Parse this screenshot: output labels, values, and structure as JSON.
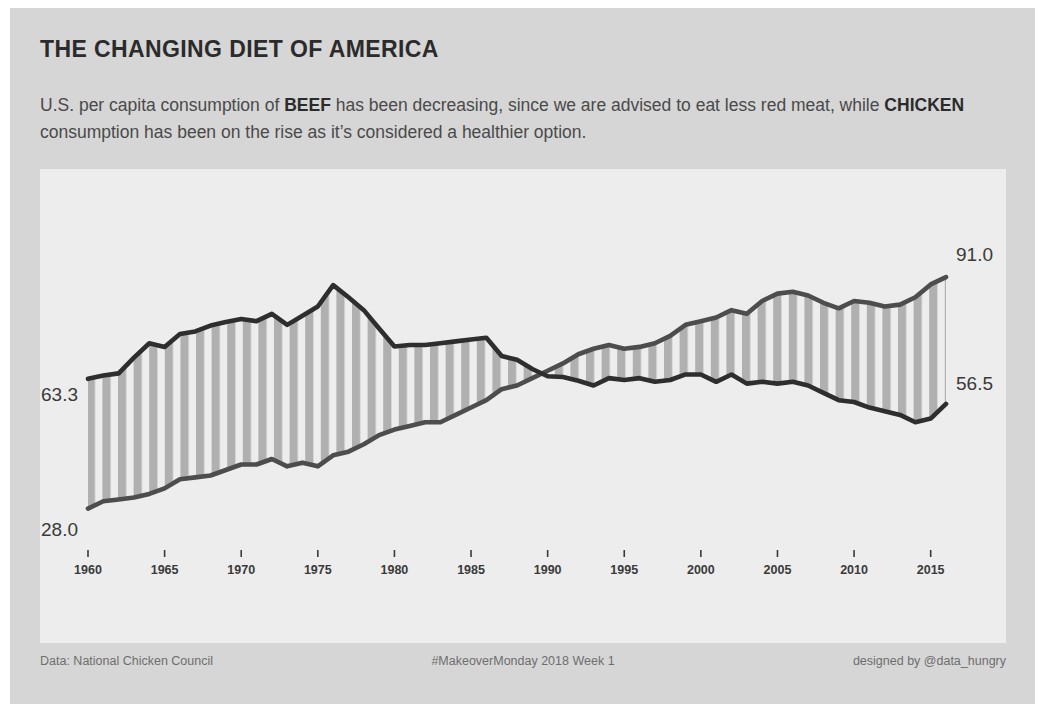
{
  "header": {
    "title": "THE CHANGING DIET OF AMERICA",
    "subtitle_part1": "U.S. per capita consumption of ",
    "subtitle_bold1": "BEEF",
    "subtitle_part2": " has been decreasing, since we are advised to eat less red meat, while ",
    "subtitle_bold2": "CHICKEN",
    "subtitle_part3": " consumption has been on the rise as it’s considered a healthier option."
  },
  "footer": {
    "source": "Data: National Chicken Council",
    "hashtag": "#MakeoverMonday 2018 Week 1",
    "credit": "designed by @data_hungry"
  },
  "colors": {
    "card_background": "#d6d6d6",
    "panel_background": "#ededed",
    "beef_line": "#2e2e2e",
    "chicken_line": "#4d4d4d",
    "band_stripe": "#b0b0b0",
    "text_primary": "#2b2b2b",
    "text_secondary": "#4a4a4a",
    "text_muted": "#6e6e6e"
  },
  "chart_data": {
    "type": "line",
    "title": "THE CHANGING DIET OF AMERICA",
    "subtitle": "U.S. per capita consumption of BEEF has been decreasing, since we are advised to eat less red meat, while CHICKEN consumption has been on the rise as it’s considered a healthier option.",
    "xlabel": "",
    "ylabel": "",
    "xlim": [
      1960,
      2016
    ],
    "ylim": [
      20,
      100
    ],
    "grid": false,
    "legend_position": "none",
    "axis_ticks": [
      "1960",
      "1965",
      "1970",
      "1975",
      "1980",
      "1985",
      "1990",
      "1995",
      "2000",
      "2005",
      "2010",
      "2015"
    ],
    "x": [
      1960,
      1961,
      1962,
      1963,
      1964,
      1965,
      1966,
      1967,
      1968,
      1969,
      1970,
      1971,
      1972,
      1973,
      1974,
      1975,
      1976,
      1977,
      1978,
      1979,
      1980,
      1981,
      1982,
      1983,
      1984,
      1985,
      1986,
      1987,
      1988,
      1989,
      1990,
      1991,
      1992,
      1993,
      1994,
      1995,
      1996,
      1997,
      1998,
      1999,
      2000,
      2001,
      2002,
      2003,
      2004,
      2005,
      2006,
      2007,
      2008,
      2009,
      2010,
      2011,
      2012,
      2013,
      2014,
      2015,
      2016
    ],
    "series": [
      {
        "name": "BEEF",
        "color": "#2e2e2e",
        "start_label": "63.3",
        "end_label": "56.5",
        "start_value": 63.3,
        "end_value": 56.5,
        "values": [
          63.3,
          64.2,
          64.8,
          69.1,
          73.0,
          72.0,
          75.5,
          76.2,
          77.8,
          78.8,
          79.6,
          79.0,
          81.0,
          78.0,
          80.5,
          83.0,
          88.8,
          85.5,
          82.0,
          77.0,
          72.1,
          72.5,
          72.5,
          73.0,
          73.5,
          74.0,
          74.5,
          69.5,
          68.5,
          66.0,
          64.0,
          63.8,
          62.8,
          61.5,
          63.5,
          63.0,
          63.5,
          62.5,
          63.0,
          64.5,
          64.5,
          62.5,
          64.5,
          62.0,
          62.5,
          62.0,
          62.5,
          61.5,
          59.5,
          57.5,
          57.0,
          55.5,
          54.5,
          53.5,
          51.5,
          52.5,
          56.5
        ]
      },
      {
        "name": "CHICKEN",
        "color": "#4d4d4d",
        "start_label": "28.0",
        "end_label": "91.0",
        "start_value": 28.0,
        "end_value": 91.0,
        "values": [
          28.0,
          30.0,
          30.5,
          31.0,
          32.0,
          33.5,
          36.0,
          36.5,
          37.0,
          38.5,
          40.0,
          40.0,
          41.5,
          39.5,
          40.5,
          39.5,
          42.5,
          43.5,
          45.5,
          48.0,
          49.5,
          50.5,
          51.5,
          51.5,
          53.5,
          55.5,
          57.5,
          60.5,
          61.5,
          63.5,
          65.5,
          67.5,
          70.0,
          71.5,
          72.5,
          71.5,
          72.0,
          73.0,
          75.0,
          78.0,
          79.0,
          80.0,
          82.0,
          81.0,
          84.5,
          86.5,
          87.0,
          86.0,
          84.0,
          82.5,
          84.5,
          84.0,
          83.0,
          83.5,
          85.5,
          89.0,
          91.0
        ]
      }
    ]
  }
}
